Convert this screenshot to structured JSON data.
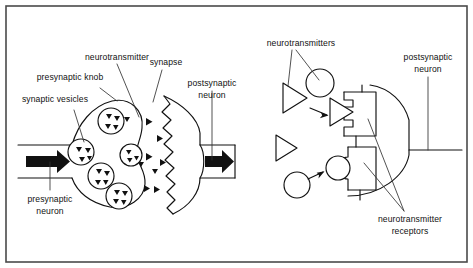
{
  "figure": {
    "background_color": "#ffffff",
    "frame_color": "#4a4a4a",
    "ink_color": "#111111",
    "width": 473,
    "height": 268
  },
  "left_panel": {
    "name": "synapse-overview-panel",
    "labels": {
      "neurotransmitter": "neurotransmitter",
      "presynaptic_knob": "presynaptic knob",
      "synaptic_vesicles": "synaptic vesicles",
      "synapse": "synapse",
      "postsynaptic_neuron": "postsynaptic\nneuron",
      "postsynaptic_neuron_line1": "postsynaptic",
      "postsynaptic_neuron_line2": "neuron",
      "presynaptic_neuron_line1": "presynaptic",
      "presynaptic_neuron_line2": "neuron"
    },
    "vesicle_count": 4,
    "impulse_arrows": 2
  },
  "right_panel": {
    "name": "receptor-binding-panel",
    "labels": {
      "neurotransmitters": "neurotransmitters",
      "postsynaptic_neuron_line1": "postsynaptic",
      "postsynaptic_neuron_line2": "neuron",
      "neurotransmitter_receptors_line1": "neurotransmitter",
      "neurotransmitter_receptors_line2": "receptors"
    },
    "free_triangles": 2,
    "free_circles": 2,
    "receptor_sites": 2,
    "binding_arrows": 2
  }
}
